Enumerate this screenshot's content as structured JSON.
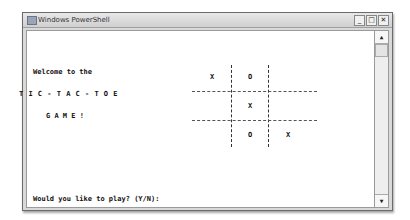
{
  "window": {
    "title": "Windows PowerShell",
    "controls": {
      "minimize": "_",
      "maximize": "□",
      "close": "✕"
    }
  },
  "console": {
    "welcome_line": "Welcome to the",
    "title_line": "T I C - T A C - T O E",
    "game_line": "G A M E !",
    "prompt": "Would you like to play? (Y/N):"
  },
  "board": {
    "cells": [
      "X",
      "O",
      "",
      "",
      "X",
      "",
      "",
      "O",
      "X"
    ]
  },
  "scrollbar": {
    "up_arrow": "▲",
    "down_arrow": "▼"
  }
}
